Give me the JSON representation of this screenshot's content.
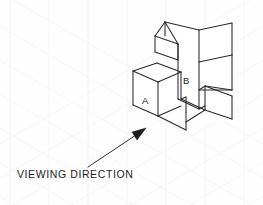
{
  "figure": {
    "type": "isometric-engineering-drawing",
    "background_color": "#fefefe",
    "line_color": "#2a2a2a",
    "grid_color": "#f4f4f6",
    "caption": "VIEWING DIRECTION",
    "labels": {
      "face_a": "A",
      "face_b": "B"
    },
    "arrow": {
      "name": "viewing-direction-arrow",
      "start": [
        88,
        167
      ],
      "end": [
        146,
        129
      ],
      "style": "solid-filled-head"
    },
    "object": {
      "description": "Stepped isometric block with a low front-left cube (face A), a tall central riser (face B), and a lower right step",
      "units": "pixels"
    }
  }
}
